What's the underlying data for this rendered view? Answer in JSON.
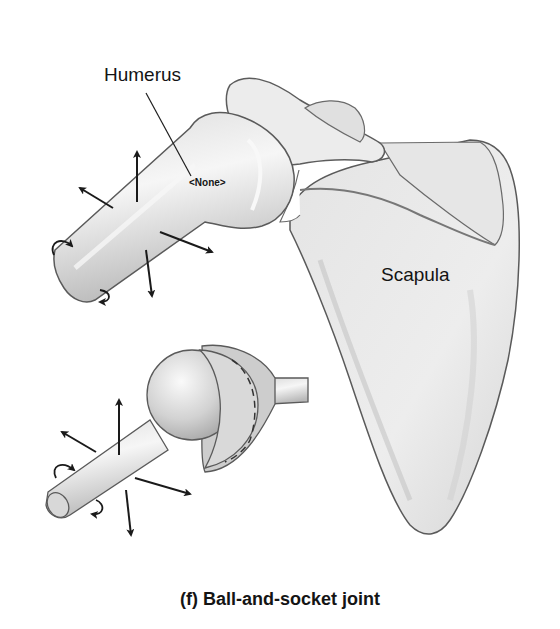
{
  "labels": {
    "humerus": "Humerus",
    "scapula": "Scapula",
    "placeholder": "<None>"
  },
  "caption": "(f) Ball-and-socket joint",
  "colors": {
    "bone_light": "#ececec",
    "bone_mid": "#cfcfcf",
    "bone_dark": "#a9a9a9",
    "outline": "#555555",
    "arrow": "#1a1a1a",
    "text": "#141414"
  },
  "icons": [
    "movement-arrow-icon",
    "rotation-arrow-icon"
  ]
}
